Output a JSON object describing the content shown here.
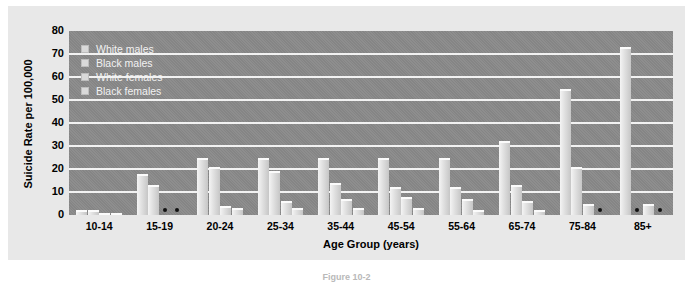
{
  "figure": {
    "caption": "Figure 10-2"
  },
  "legend": {
    "position": "top-left-inside",
    "items": [
      {
        "label": "White males",
        "swatch": "legend-swatch-white-males"
      },
      {
        "label": "Black males",
        "swatch": "legend-swatch-black-males"
      },
      {
        "label": "White females",
        "swatch": "legend-swatch-white-females"
      },
      {
        "label": "Black females",
        "swatch": "legend-swatch-black-females"
      }
    ]
  },
  "axes": {
    "ylabel": "Suicide Rate per 100,000",
    "xlabel": "Age Group (years)",
    "yticks": [
      "0",
      "10",
      "20",
      "30",
      "40",
      "50",
      "60",
      "70",
      "80"
    ],
    "ylim": [
      0,
      80
    ]
  },
  "colors": {
    "plot_background": "#8a8a8a",
    "panel_background": "#e8e8e8",
    "gridline": "#f2f2f2",
    "bar_light": "#f4f4f4",
    "bar_dark": "#c6c6c6",
    "legend_text": "#f2f2f2",
    "axis_text": "#000000"
  },
  "notes": {
    "suppressed_marker": "•",
    "suppressed_meaning": "value too small to plot"
  },
  "chart_data": {
    "type": "bar",
    "title": "",
    "xlabel": "Age Group (years)",
    "ylabel": "Suicide Rate per 100,000",
    "ylim": [
      0,
      80
    ],
    "yticks": [
      0,
      10,
      20,
      30,
      40,
      50,
      60,
      70,
      80
    ],
    "grid": true,
    "legend_position": "upper left (inside plot)",
    "categories": [
      "10-14",
      "15-19",
      "20-24",
      "25-34",
      "35-44",
      "45-54",
      "55-64",
      "65-74",
      "75-84",
      "85+"
    ],
    "series": [
      {
        "name": "White males",
        "values": [
          2,
          18,
          25,
          25,
          25,
          25,
          25,
          32,
          55,
          73
        ]
      },
      {
        "name": "Black males",
        "values": [
          2,
          13,
          21,
          19,
          14,
          12,
          12,
          13,
          21,
          0
        ]
      },
      {
        "name": "White females",
        "values": [
          1,
          3,
          4,
          6,
          7,
          8,
          7,
          6,
          5,
          5
        ]
      },
      {
        "name": "Black females",
        "values": [
          1,
          0,
          3,
          3,
          3,
          3,
          2,
          2,
          0,
          0
        ]
      }
    ],
    "suppressed": [
      {
        "category": "15-19",
        "series": "Black females"
      },
      {
        "category": "15-19",
        "series": "White females"
      },
      {
        "category": "75-84",
        "series": "Black females"
      },
      {
        "category": "85+",
        "series": "Black males"
      },
      {
        "category": "85+",
        "series": "Black females"
      }
    ]
  }
}
